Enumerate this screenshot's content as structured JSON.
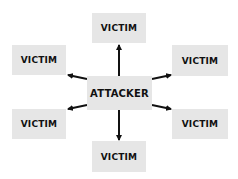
{
  "diagram": {
    "center": {
      "label": "ATTACKER"
    },
    "nodes": [
      {
        "id": "top",
        "label": "VICTIM"
      },
      {
        "id": "upper-left",
        "label": "VICTIM"
      },
      {
        "id": "upper-right",
        "label": "VICTIM"
      },
      {
        "id": "lower-left",
        "label": "VICTIM"
      },
      {
        "id": "lower-right",
        "label": "VICTIM"
      },
      {
        "id": "bottom",
        "label": "VICTIM"
      }
    ],
    "edges": [
      {
        "from": "ATTACKER",
        "to": "top"
      },
      {
        "from": "ATTACKER",
        "to": "upper-left"
      },
      {
        "from": "ATTACKER",
        "to": "upper-right"
      },
      {
        "from": "ATTACKER",
        "to": "lower-left"
      },
      {
        "from": "ATTACKER",
        "to": "lower-right"
      },
      {
        "from": "ATTACKER",
        "to": "bottom"
      }
    ],
    "colors": {
      "box_fill": "#e6e6e6",
      "text": "#111111",
      "arrow": "#111111"
    }
  }
}
